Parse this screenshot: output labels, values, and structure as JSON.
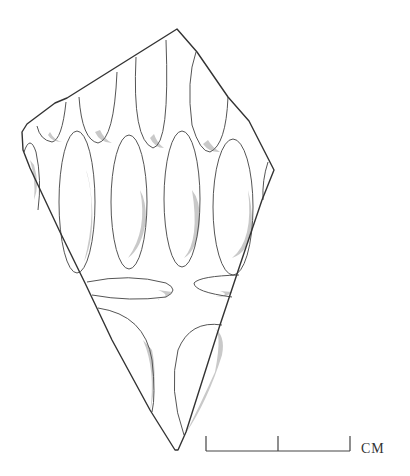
{
  "figure": {
    "scale_bar": {
      "unit_label": "CM",
      "segments": 2
    },
    "colors": {
      "outline": "#333333",
      "shading": "#c9c9c9",
      "background": "#ffffff"
    }
  }
}
